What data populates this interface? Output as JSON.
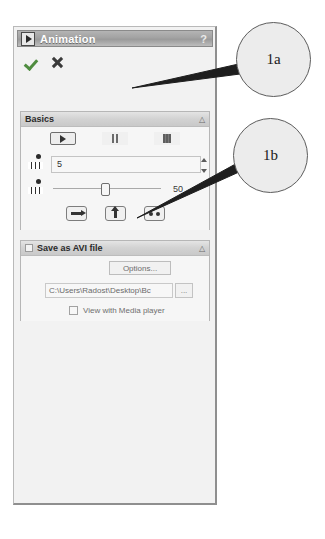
{
  "panel": {
    "title": "Animation",
    "title_icon": "play-triangle-icon",
    "help_icon": "?",
    "confirm": {
      "accept_icon": "check-icon",
      "cancel_icon": "x-icon"
    }
  },
  "basics": {
    "title": "Basics",
    "collapse_icon": "△",
    "transport": {
      "play_icon": "play-icon",
      "pause_icon": "pause-icon",
      "stop_icon": "stop-icon"
    },
    "frames": {
      "icon": "film-strip-icon",
      "value": "5",
      "spin_up_icon": "▲",
      "spin_down_icon": "▼"
    },
    "speed": {
      "icon": "film-strip-icon",
      "value": "50"
    },
    "nav": {
      "step_forward_icon": "arrow-right-icon",
      "step_up_icon": "arrow-up-icon",
      "loop_icon": "two-dots-icon"
    }
  },
  "avi": {
    "title": "Save as AVI file",
    "collapse_icon": "△",
    "options_label": "Options...",
    "path_value": "C:\\Users\\Radost\\Desktop\\Bc",
    "browse_label": "...",
    "media_label": "View with Media player"
  },
  "annotations": {
    "callout_1a": "1a",
    "callout_1b": "1b"
  },
  "colors": {
    "titlebar": "#a2a2a2",
    "panel_bg": "#f2f2f2",
    "accept_green": "#4f8c3f",
    "cancel_dark": "#3a3a3a"
  }
}
